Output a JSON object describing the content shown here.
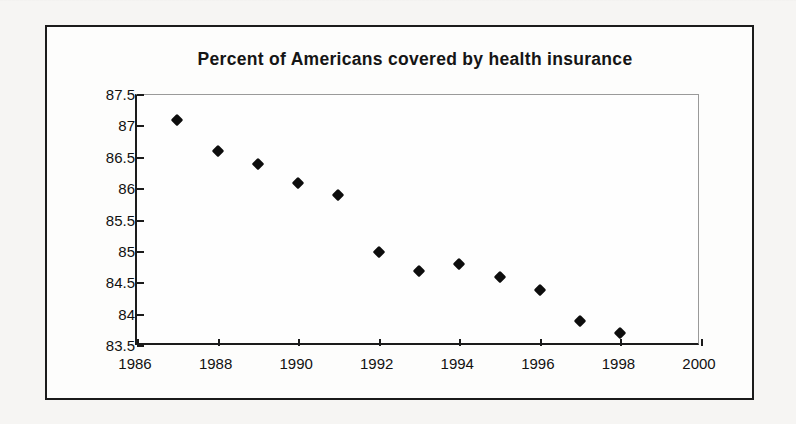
{
  "chart_data": {
    "type": "scatter",
    "title": "Percent of Americans covered by health insurance",
    "xlabel": "",
    "ylabel": "",
    "xlim": [
      1986,
      2000
    ],
    "ylim": [
      83.5,
      87.5
    ],
    "grid": false,
    "legend": null,
    "marker": "diamond",
    "marker_color": "#0d0d0d",
    "x_ticks": [
      "1986",
      "1988",
      "1990",
      "1992",
      "1994",
      "1996",
      "1998",
      "2000"
    ],
    "y_ticks": [
      "83.5",
      "84",
      "84.5",
      "85",
      "85.5",
      "86",
      "86.5",
      "87",
      "87.5"
    ],
    "x": [
      1987,
      1988,
      1989,
      1990,
      1991,
      1992,
      1993,
      1994,
      1995,
      1996,
      1997,
      1998
    ],
    "values": [
      87.1,
      86.6,
      86.4,
      86.1,
      85.9,
      85.0,
      84.7,
      84.8,
      84.6,
      84.4,
      83.9,
      83.7
    ],
    "points": [
      {
        "x": 1987,
        "y": 87.1
      },
      {
        "x": 1988,
        "y": 86.6
      },
      {
        "x": 1989,
        "y": 86.4
      },
      {
        "x": 1990,
        "y": 86.1
      },
      {
        "x": 1991,
        "y": 85.9
      },
      {
        "x": 1992,
        "y": 85.0
      },
      {
        "x": 1993,
        "y": 84.7
      },
      {
        "x": 1994,
        "y": 84.8
      },
      {
        "x": 1995,
        "y": 84.6
      },
      {
        "x": 1996,
        "y": 84.4
      },
      {
        "x": 1997,
        "y": 83.9
      },
      {
        "x": 1998,
        "y": 83.7
      }
    ]
  }
}
